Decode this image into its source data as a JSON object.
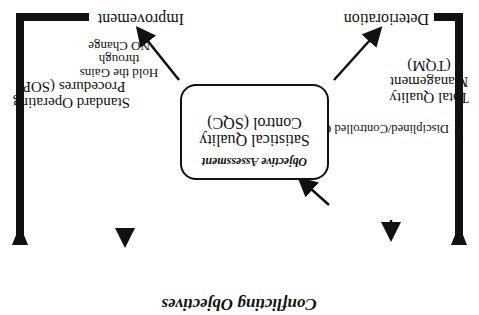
{
  "title": "Conflicting Objectives",
  "orientation": "rotated-180",
  "center_box": {
    "line1": "Satistical Quality",
    "line2": "Control (SQC)",
    "subtitle": "Objective Assessment"
  },
  "outcomes": {
    "left": "Deterioration",
    "right": "Improvement"
  },
  "left_column": {
    "line1": "Total Quality",
    "line2": "Management",
    "line3": "(TQM)",
    "action": "Disciplined/Controlled CHANGE"
  },
  "right_column": {
    "line1": "Standard Operating",
    "line2": "Procedures (SOP)",
    "action_line1": "Hold the Gains",
    "action_line2": "through",
    "action_line3": "NO Change"
  }
}
